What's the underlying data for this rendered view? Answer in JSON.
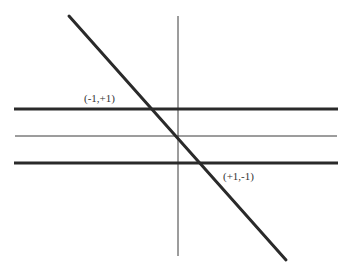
{
  "diagram": {
    "colors": {
      "background": "#ffffff",
      "line": "#2a2a2a",
      "axis": "#3a3a3a",
      "text": "#333333"
    },
    "lines": {
      "diagonal": {
        "x1": 69,
        "y1": 16,
        "x2": 286,
        "y2": 260,
        "width": 3
      },
      "vertical_axis": {
        "x1": 178,
        "y1": 16,
        "x2": 178,
        "y2": 256,
        "width": 1
      },
      "horizontal_top": {
        "x1": 14,
        "y1": 109,
        "x2": 338,
        "y2": 109,
        "width": 3
      },
      "horizontal_middle": {
        "x1": 15,
        "y1": 136,
        "x2": 337,
        "y2": 136,
        "width": 1
      },
      "horizontal_bottom": {
        "x1": 14,
        "y1": 163,
        "x2": 338,
        "y2": 163,
        "width": 3
      }
    },
    "labels": {
      "upper_point": {
        "text": "(-1,+1)",
        "x": 84,
        "y": 102
      },
      "lower_point": {
        "text": "(+1,-1)",
        "x": 223,
        "y": 180
      }
    }
  }
}
